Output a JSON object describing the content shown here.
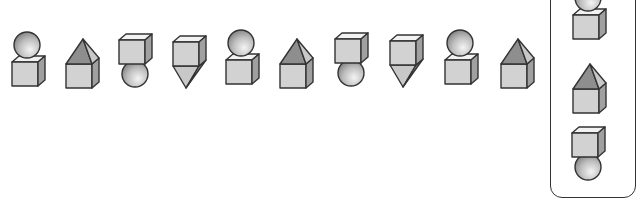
{
  "puzzle": {
    "type": "shape-sequence",
    "sequence": [
      {
        "index": 1,
        "shape": "sphere-on-cube"
      },
      {
        "index": 2,
        "shape": "pyramid-on-cube"
      },
      {
        "index": 3,
        "shape": "cube-on-sphere"
      },
      {
        "index": 4,
        "shape": "cube-on-inverted-pyramid"
      },
      {
        "index": 5,
        "shape": "sphere-on-cube"
      },
      {
        "index": 6,
        "shape": "pyramid-on-cube"
      },
      {
        "index": 7,
        "shape": "cube-on-sphere"
      },
      {
        "index": 8,
        "shape": "cube-on-inverted-pyramid"
      },
      {
        "index": 9,
        "shape": "sphere-on-cube"
      },
      {
        "index": 10,
        "shape": "pyramid-on-cube"
      }
    ],
    "choices": [
      {
        "index": 1,
        "shape": "sphere-on-cube"
      },
      {
        "index": 2,
        "shape": "pyramid-on-cube"
      },
      {
        "index": 3,
        "shape": "cube-on-sphere"
      }
    ]
  },
  "colors": {
    "outline": "#333333",
    "cube_front": "#d2d2d2",
    "cube_top": "#f2f2f2",
    "cube_side": "#a0a0a0",
    "pyramid_left": "#8e8e8e",
    "pyramid_right": "#c8c8c8"
  }
}
